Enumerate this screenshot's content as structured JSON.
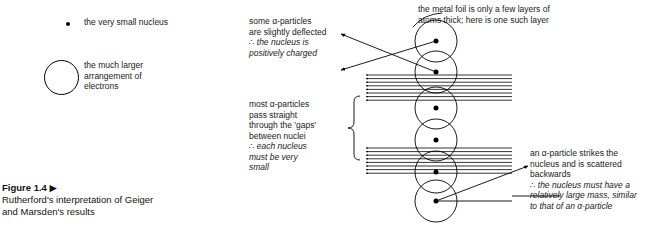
{
  "figure": {
    "caption_title": "Figure 1.4 ▶",
    "caption_body": "Rutherford's interpretation of Geiger\nand Marsden's results"
  },
  "legend": {
    "nucleus": {
      "icon": "small-filled-dot",
      "label": "the very small nucleus"
    },
    "electrons": {
      "icon": "large-open-circle",
      "label": "the much larger\narrangement of\nelectrons"
    }
  },
  "annotations": {
    "deflected": {
      "plain": "some α-particles\nare slightly deflected",
      "italic": "∴ the nucleus is\npositively charged"
    },
    "most_pass": {
      "plain": "most α-particles\npass straight\nthrough the 'gaps'\nbetween nuclei",
      "italic": "∴ each nucleus\nmust be very\nsmall"
    },
    "foil": {
      "plain": "the metal foil is only a few layers of\natoms thick; here is one such layer"
    },
    "backscatter": {
      "plain": "an α-particle strikes the\nnucleus and is scattered\nbackwards",
      "italic": "∴ the nucleus must have a\nrelatively large mass, similar\nto that of an α-particle"
    }
  },
  "diagram": {
    "atom_count": 6,
    "atom_radius": 21,
    "atom_centers_x": 436,
    "atom_centers_y": [
      41,
      72,
      108,
      140,
      172,
      201
    ],
    "nucleus_radius": 2.5,
    "beam_bundle_upper_count": 8,
    "beam_bundle_lower_count": 8,
    "beam_left_x": 366,
    "beam_right_x": 512,
    "colors": {
      "ink": "#000000",
      "text": "#1a1a1a",
      "paper": "#ffffff"
    }
  }
}
